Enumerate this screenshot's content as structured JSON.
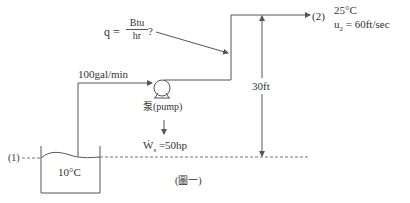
{
  "heat": {
    "lhs": "q =",
    "numerator": "Btu",
    "denominator": "hr",
    "suffix": "?"
  },
  "flow_rate": "100gal/min",
  "pump_label": "泵(pump)",
  "shaft_work": {
    "symbol": "Ẇ",
    "subscript": "s",
    "value": "=50hp"
  },
  "point1": {
    "label": "(1)",
    "temperature": "10°C"
  },
  "point2": {
    "label": "(2)",
    "temperature": "25°C",
    "velocity_symbol": "u",
    "velocity_subscript": "2",
    "velocity_value": "= 60ft/sec"
  },
  "height": "30ft",
  "caption": "(圖一)",
  "colors": {
    "line": "#555555",
    "text": "#333333",
    "dash": "#777777"
  }
}
